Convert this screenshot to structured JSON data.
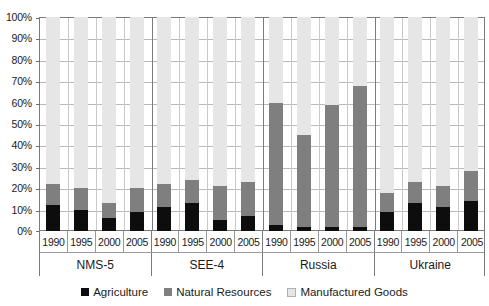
{
  "chart_data": {
    "type": "bar",
    "stacked": true,
    "stack_mode": "percent",
    "title": "",
    "subtitle": "",
    "xlabel": "",
    "ylabel": "",
    "ylim": [
      0,
      100
    ],
    "yticks": [
      "0%",
      "10%",
      "20%",
      "30%",
      "40%",
      "50%",
      "60%",
      "70%",
      "80%",
      "90%",
      "100%"
    ],
    "ytick_values": [
      0,
      10,
      20,
      30,
      40,
      50,
      60,
      70,
      80,
      90,
      100
    ],
    "grid": true,
    "legend_position": "bottom",
    "groups": [
      "NMS-5",
      "SEE-4",
      "Russia",
      "Ukraine"
    ],
    "categories": [
      "1990",
      "1995",
      "2000",
      "2005",
      "1990",
      "1995",
      "2000",
      "2005",
      "1990",
      "1995",
      "2000",
      "2005",
      "1990",
      "1995",
      "2000",
      "2005"
    ],
    "series": [
      {
        "name": "Agriculture",
        "color": "#0d0d0d",
        "values": [
          12,
          10,
          6,
          9,
          11,
          13,
          5,
          7,
          3,
          2,
          2,
          2,
          9,
          13,
          11,
          14
        ]
      },
      {
        "name": "Natural Resources",
        "color": "#7f7f7f",
        "values": [
          10,
          10,
          7,
          11,
          11,
          11,
          16,
          16,
          57,
          43,
          57,
          66,
          9,
          10,
          10,
          14
        ]
      },
      {
        "name": "Manufactured Goods",
        "color": "#e6e6e6",
        "values": [
          78,
          80,
          87,
          80,
          78,
          76,
          79,
          77,
          40,
          55,
          41,
          32,
          82,
          77,
          79,
          72
        ]
      }
    ],
    "cumulative_tops": {
      "agriculture": [
        12,
        10,
        6,
        9,
        11,
        13,
        5,
        7,
        3,
        2,
        2,
        2,
        9,
        13,
        11,
        14
      ],
      "plus_natural": [
        22,
        20,
        13,
        20,
        22,
        24,
        21,
        23,
        60,
        45,
        59,
        68,
        18,
        23,
        21,
        28
      ]
    }
  },
  "legend": {
    "items": [
      {
        "label": "Agriculture",
        "swatch": "black-square-icon"
      },
      {
        "label": "Natural Resources",
        "swatch": "gray-square-icon"
      },
      {
        "label": "Manufactured Goods",
        "swatch": "light-gray-square-icon"
      }
    ]
  },
  "colors": {
    "agriculture": "#0d0d0d",
    "natural_resources": "#7f7f7f",
    "manufactured_goods": "#e6e6e6",
    "axis": "#7b7b7b",
    "gridline": "#b9b9b9",
    "background": "#ffffff"
  }
}
